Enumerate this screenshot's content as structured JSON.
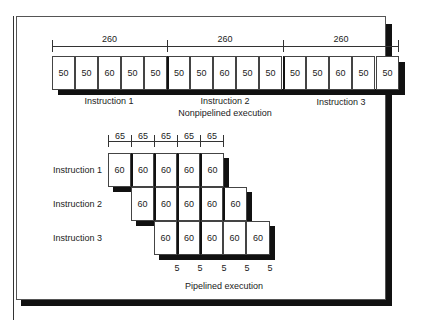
{
  "nonpipelined": {
    "title": "Nonpipelined execution",
    "durations": [
      "260",
      "260",
      "260"
    ],
    "instructions": [
      {
        "label": "Instruction 1",
        "stages": [
          "50",
          "50",
          "60",
          "50",
          "50"
        ]
      },
      {
        "label": "Instruction 2",
        "stages": [
          "50",
          "50",
          "60",
          "50",
          "50"
        ]
      },
      {
        "label": "Instruction 3",
        "stages": [
          "50",
          "50",
          "60",
          "50",
          "50"
        ]
      }
    ]
  },
  "pipelined": {
    "title": "Pipelined execution",
    "stage_times": [
      "65",
      "65",
      "65",
      "65",
      "65"
    ],
    "instructions": [
      {
        "label": "Instruction 1",
        "stages": [
          "60",
          "60",
          "60",
          "60",
          "60"
        ]
      },
      {
        "label": "Instruction 2",
        "stages": [
          "60",
          "60",
          "60",
          "60",
          "60"
        ]
      },
      {
        "label": "Instruction 3",
        "stages": [
          "60",
          "60",
          "60",
          "60",
          "60"
        ]
      }
    ],
    "latch_overheads": [
      "5",
      "5",
      "5",
      "5",
      "5"
    ]
  }
}
